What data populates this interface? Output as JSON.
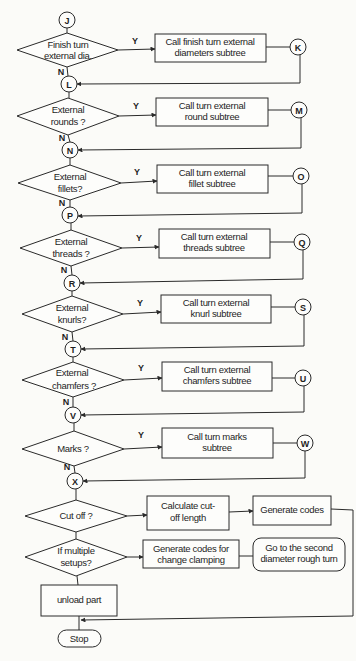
{
  "diagram": {
    "type": "flowchart",
    "start_connector": "J",
    "decisions": [
      {
        "id": "d1",
        "line1": "Finish turn",
        "line2": "external dia.",
        "yes_label": "Y",
        "no_label": "N",
        "action": {
          "line1": "Call finish turn external",
          "line2": "diameters subtree"
        },
        "out_connector": "K",
        "join_connector": "L"
      },
      {
        "id": "d2",
        "line1": "External",
        "line2": "rounds ?",
        "yes_label": "Y",
        "no_label": "N",
        "action": {
          "line1": "Call turn  external",
          "line2": "round subtree"
        },
        "out_connector": "M",
        "join_connector": "N"
      },
      {
        "id": "d3",
        "line1": "External",
        "line2": "fillets?",
        "yes_label": "Y",
        "no_label": "N",
        "action": {
          "line1": "Call turn  external",
          "line2": "fillet subtree"
        },
        "out_connector": "O",
        "join_connector": "P"
      },
      {
        "id": "d4",
        "line1": "External",
        "line2": "threads ?",
        "yes_label": "Y",
        "no_label": "N",
        "action": {
          "line1": "Call turn external",
          "line2": "threads subtree"
        },
        "out_connector": "Q",
        "join_connector": "R"
      },
      {
        "id": "d5",
        "line1": "External",
        "line2": "knurls?",
        "yes_label": "Y",
        "no_label": "N",
        "action": {
          "line1": "Call turn  external",
          "line2": "knurl  subtree"
        },
        "out_connector": "S",
        "join_connector": "T"
      },
      {
        "id": "d6",
        "line1": "External",
        "line2": "chamfers ?",
        "yes_label": "Y",
        "no_label": "N",
        "action": {
          "line1": "Call turn external",
          "line2": "chamfers subtree"
        },
        "out_connector": "U",
        "join_connector": "V"
      },
      {
        "id": "d7",
        "line1": "Marks ?",
        "line2": "",
        "yes_label": "Y",
        "no_label": "N",
        "action": {
          "line1": "Call turn marks",
          "line2": "subtree"
        },
        "out_connector": "W",
        "join_connector": "X"
      }
    ],
    "cutoff": {
      "decision": "Cut off ?",
      "calc": {
        "line1": "Calculate  cut-",
        "line2": "off  length"
      },
      "generate": "Generate codes"
    },
    "setups": {
      "decision": {
        "line1": "If multiple",
        "line2": "setups?"
      },
      "generate": {
        "line1": "Generate codes for",
        "line2": "change clamping"
      },
      "goto": {
        "line1": "Go to the second",
        "line2": "diameter rough turn"
      }
    },
    "unload": "unload part",
    "stop": "Stop"
  }
}
